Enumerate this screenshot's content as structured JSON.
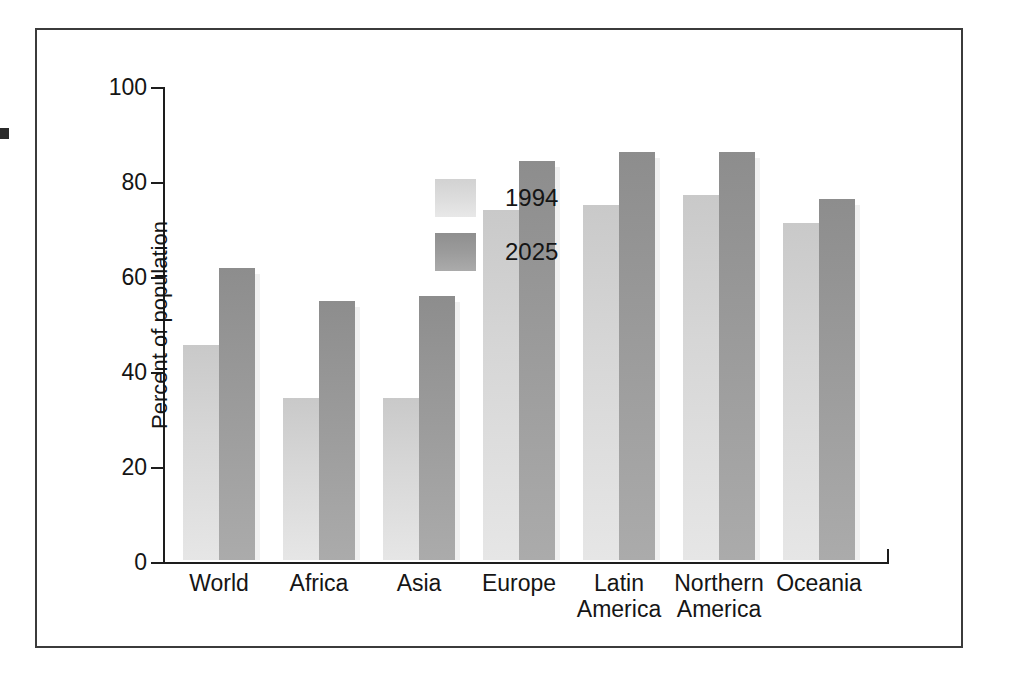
{
  "chart_data": {
    "type": "bar",
    "title": "",
    "subtitle": "",
    "xlabel": "",
    "ylabel": "Percent of population",
    "ylim": [
      0,
      100
    ],
    "yticks": [
      0,
      20,
      40,
      60,
      80,
      100
    ],
    "ytick_labels": [
      "0",
      "20",
      "40",
      "60",
      "80",
      "100"
    ],
    "grid": false,
    "legend_position": "top-left-inside",
    "categories": [
      "World",
      "Africa",
      "Asia",
      "Europe",
      "Latin\nAmerica",
      "Northern\nAmerica",
      "Oceania"
    ],
    "series": [
      {
        "name": "1994",
        "color": "#dcdcdc",
        "values": [
          45.3,
          34.2,
          34.1,
          73.6,
          74.8,
          76.9,
          70.9
        ]
      },
      {
        "name": "2025",
        "color": "#9a9a9a",
        "values": [
          61.5,
          54.5,
          55.5,
          84.0,
          86.0,
          86.0,
          76.0
        ]
      }
    ]
  },
  "legend": {
    "items": [
      {
        "label": "1994",
        "swatch": "light-gray-swatch"
      },
      {
        "label": "2025",
        "swatch": "dark-gray-swatch"
      }
    ]
  },
  "axes": {
    "y_title": "Percent of population",
    "y_tick_labels": [
      "100",
      "80",
      "60",
      "40",
      "20",
      "0"
    ]
  }
}
